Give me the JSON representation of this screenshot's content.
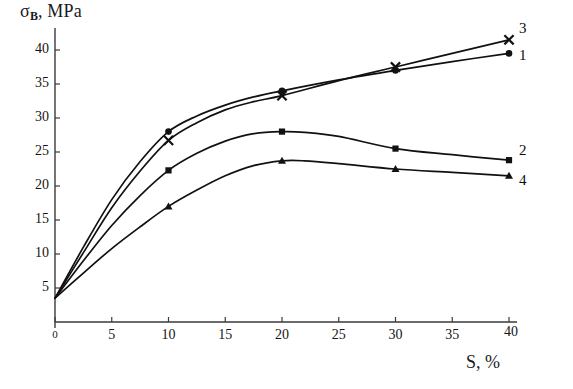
{
  "chart_data": {
    "type": "line",
    "title": "",
    "xlabel": "S, %",
    "ylabel": "σB, MPa",
    "ylabel_base": "σ",
    "ylabel_sub": "B",
    "ylabel_rest": ", MPa",
    "xlim": [
      0,
      40
    ],
    "ylim": [
      0,
      43
    ],
    "grid": false,
    "legend_position": "right-inline",
    "x_ticks": [
      0,
      5,
      10,
      15,
      20,
      25,
      30,
      35,
      40
    ],
    "x_tick_labels": [
      "0",
      "5",
      "10",
      "15",
      "20",
      "25",
      "30",
      "35",
      "40"
    ],
    "y_ticks": [
      5,
      10,
      15,
      20,
      25,
      30,
      35,
      40
    ],
    "y_tick_labels": [
      "5",
      "10",
      "15",
      "20",
      "25",
      "30",
      "35",
      "40"
    ],
    "series": [
      {
        "name": "1",
        "label": "1",
        "marker": "circle",
        "color": "#111111",
        "x": [
          0,
          2.5,
          5,
          7.5,
          10,
          12.5,
          15,
          17.5,
          20,
          25,
          30,
          35,
          40
        ],
        "values": [
          3.5,
          11.0,
          18.0,
          23.6,
          28.0,
          30.3,
          31.9,
          33.1,
          34.0,
          35.6,
          37.0,
          38.3,
          39.5
        ],
        "marker_x": [
          10,
          20,
          30,
          40
        ],
        "marker_values": [
          28.0,
          34.0,
          37.0,
          39.5
        ]
      },
      {
        "name": "3",
        "label": "3",
        "marker": "cross",
        "color": "#111111",
        "x": [
          0,
          2.5,
          5,
          7.5,
          10,
          12.5,
          15,
          17.5,
          20,
          25,
          30,
          35,
          40
        ],
        "values": [
          3.5,
          10.2,
          16.8,
          22.2,
          26.7,
          29.3,
          31.2,
          32.4,
          33.3,
          35.5,
          37.5,
          39.5,
          41.5
        ],
        "marker_x": [
          10,
          20,
          30,
          40
        ],
        "marker_values": [
          26.7,
          33.3,
          37.5,
          41.5
        ]
      },
      {
        "name": "2",
        "label": "2",
        "marker": "square",
        "color": "#111111",
        "x": [
          0,
          2.5,
          5,
          7.5,
          10,
          12.5,
          15,
          17.5,
          20,
          22,
          25,
          30,
          35,
          40
        ],
        "values": [
          3.5,
          9.0,
          14.2,
          18.6,
          22.3,
          24.8,
          26.6,
          27.7,
          28.0,
          27.9,
          27.3,
          25.5,
          24.6,
          23.8
        ],
        "marker_x": [
          10,
          20,
          30,
          40
        ],
        "marker_values": [
          22.3,
          28.0,
          25.5,
          23.8
        ]
      },
      {
        "name": "4",
        "label": "4",
        "marker": "triangle",
        "color": "#111111",
        "x": [
          0,
          2.5,
          5,
          7.5,
          10,
          12.5,
          15,
          17.5,
          20,
          22,
          25,
          30,
          35,
          40
        ],
        "values": [
          3.5,
          7.2,
          10.8,
          14.0,
          17.0,
          19.4,
          21.5,
          23.0,
          23.7,
          23.7,
          23.3,
          22.5,
          22.0,
          21.5
        ],
        "marker_x": [
          10,
          20,
          30,
          40
        ],
        "marker_values": [
          17.0,
          23.7,
          22.5,
          21.5
        ]
      }
    ],
    "annotations": [
      {
        "text": "3",
        "series": "3"
      },
      {
        "text": "1",
        "series": "1"
      },
      {
        "text": "2",
        "series": "2"
      },
      {
        "text": "4",
        "series": "4"
      }
    ]
  }
}
